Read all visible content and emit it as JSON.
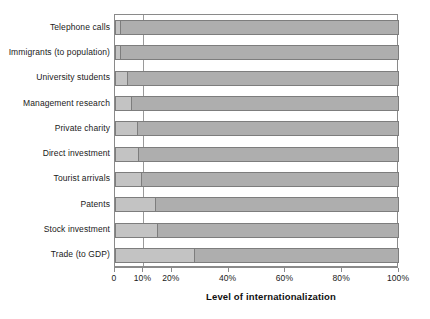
{
  "chart_data": {
    "type": "bar",
    "orientation": "horizontal",
    "stacked": true,
    "title": "",
    "xlabel": "Level of internationalization",
    "ylabel": "",
    "xlim": [
      0,
      100
    ],
    "xunit": "%",
    "grid": false,
    "gridlines_drawn": [
      "10%"
    ],
    "legend": null,
    "xticks": [
      0,
      10,
      20,
      40,
      60,
      80,
      100
    ],
    "xticklabels": [
      "0",
      "10%",
      "20%",
      "40%",
      "60%",
      "80%",
      "100%"
    ],
    "categories": [
      "Telephone calls",
      "Immigrants (to population)",
      "University students",
      "Management research",
      "Private charity",
      "Direct investment",
      "Tourist arrivals",
      "Patents",
      "Stock investment",
      "Trade (to GDP)"
    ],
    "series": [
      {
        "name": "International share",
        "color": "#c3c3c3",
        "values": [
          2,
          2,
          4.5,
          6,
          8,
          8.5,
          9.5,
          14.5,
          15,
          28
        ]
      },
      {
        "name": "Domestic share",
        "color": "#aeaeae",
        "values": [
          98,
          98,
          95.5,
          94,
          92,
          91.5,
          90.5,
          85.5,
          85,
          72
        ]
      }
    ],
    "bars": [
      {
        "label": "Telephone calls",
        "value": 2,
        "remainder": 98
      },
      {
        "label": "Immigrants (to population)",
        "value": 2,
        "remainder": 98
      },
      {
        "label": "University students",
        "value": 4.5,
        "remainder": 95.5
      },
      {
        "label": "Management research",
        "value": 6,
        "remainder": 94
      },
      {
        "label": "Private charity",
        "value": 8,
        "remainder": 92
      },
      {
        "label": "Direct investment",
        "value": 8.5,
        "remainder": 91.5
      },
      {
        "label": "Tourist arrivals",
        "value": 9.5,
        "remainder": 90.5
      },
      {
        "label": "Patents",
        "value": 14.5,
        "remainder": 85.5
      },
      {
        "label": "Stock investment",
        "value": 15,
        "remainder": 85
      },
      {
        "label": "Trade (to GDP)",
        "value": 28,
        "remainder": 72
      }
    ]
  },
  "colors": {
    "segment_light": "#c3c3c3",
    "segment_dark": "#aeaeae",
    "frame": "#8a8a8a",
    "gridline": "#9a9a9a",
    "text": "#1a1a1a",
    "background": "#ffffff"
  }
}
